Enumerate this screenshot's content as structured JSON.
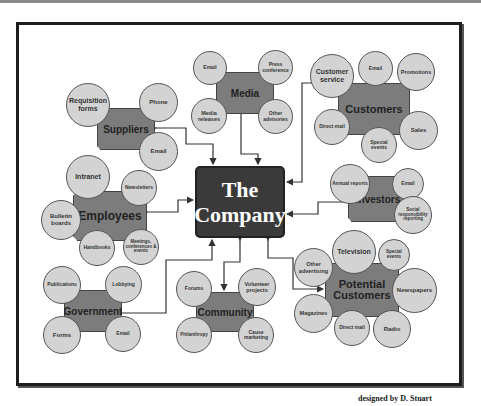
{
  "diagram": {
    "center": {
      "line1": "The",
      "line2": "Company"
    },
    "credit": "designed by D. Stuart",
    "colors": {
      "hub": "#7c7c7c",
      "circle": "#d3d3d3",
      "center": "#3a3a3a",
      "frame": "#1e1e1e"
    },
    "clusters": {
      "suppliers": {
        "label": "Suppliers",
        "items": [
          "Requisition forms",
          "Phone",
          "Email"
        ]
      },
      "media": {
        "label": "Media",
        "items": [
          "Email",
          "Press conference",
          "Media releases",
          "Other advisories"
        ]
      },
      "customers": {
        "label": "Customers",
        "items": [
          "Customer service",
          "Email",
          "Promotions",
          "Direct mail",
          "Special events",
          "Sales"
        ]
      },
      "employees": {
        "label": "Employees",
        "items": [
          "Intranet",
          "Newsletters",
          "Bulletin boards",
          "Handbooks",
          "Meetings, conferences & events"
        ]
      },
      "investors": {
        "label": "Investors",
        "items": [
          "Annual reports",
          "Email",
          "Social responsibility reporting"
        ]
      },
      "government": {
        "label": "Government",
        "items": [
          "Publications",
          "Lobbying",
          "Forms",
          "Email"
        ]
      },
      "community": {
        "label": "Community",
        "items": [
          "Forums",
          "Volunteer projects",
          "Philanthropy",
          "Cause marketing"
        ]
      },
      "potential": {
        "label": "Potential Customers",
        "items": [
          "Television",
          "Special events",
          "Other advertising",
          "Newspapers",
          "Magazines",
          "Direct mail",
          "Radio"
        ]
      }
    }
  }
}
